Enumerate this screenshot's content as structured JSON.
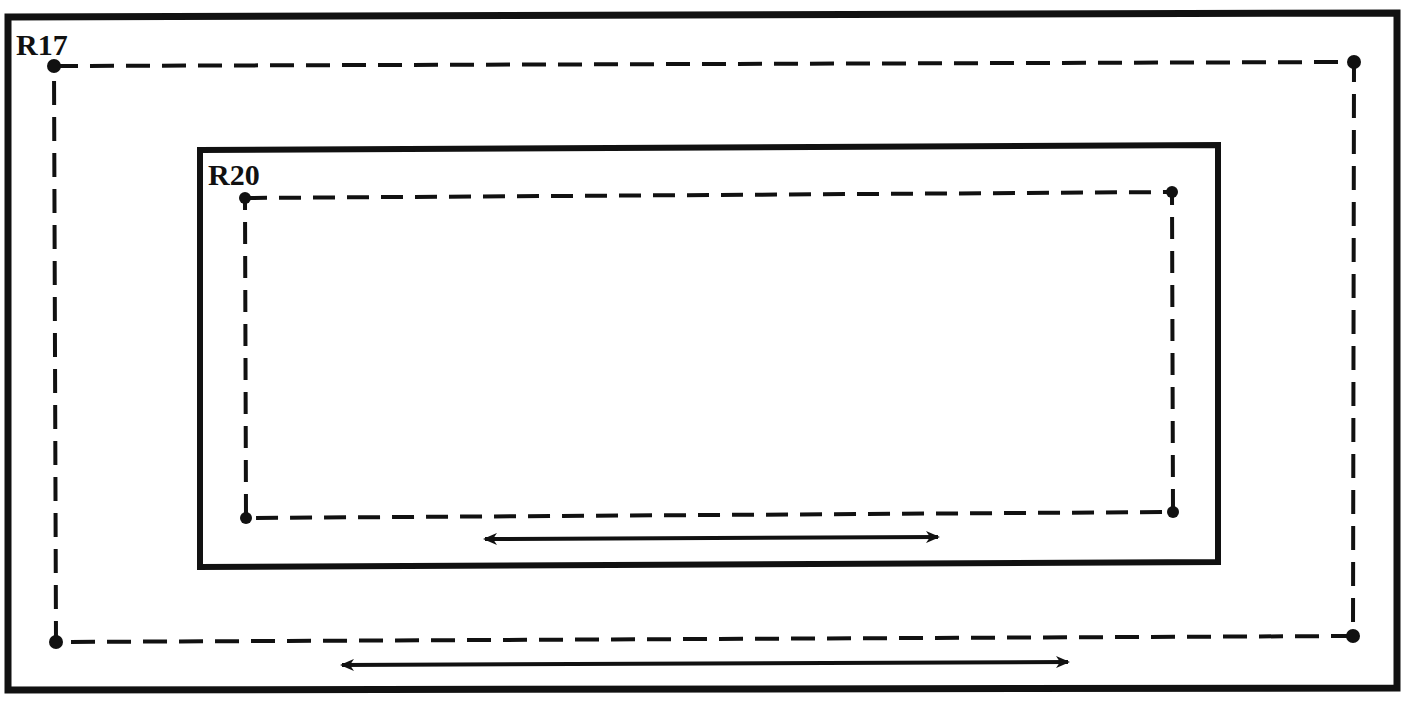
{
  "diagram": {
    "type": "nested-rectangles",
    "stroke_color": "#111111",
    "background": "#ffffff",
    "regions": [
      {
        "id": "R17",
        "label": "R17",
        "outer_rect": {
          "x1": 8,
          "y1": 17,
          "x2": 1397,
          "y2": 688
        },
        "dashed_rect": {
          "x1": 54,
          "y1": 66,
          "x2": 1354,
          "y2": 638
        },
        "corner_points": [
          [
            54,
            66
          ],
          [
            1354,
            62
          ],
          [
            1353,
            636
          ],
          [
            56,
            642
          ]
        ],
        "arrow": {
          "x1": 340,
          "y1": 665,
          "x2": 1070,
          "y2": 662,
          "style": "double-headed"
        }
      },
      {
        "id": "R20",
        "label": "R20",
        "outer_rect": {
          "x1": 200,
          "y1": 146,
          "x2": 1218,
          "y2": 567
        },
        "dashed_rect": {
          "x1": 245,
          "y1": 198,
          "x2": 1173,
          "y2": 517
        },
        "corner_points": [
          [
            245,
            198
          ],
          [
            1172,
            192
          ],
          [
            1173,
            512
          ],
          [
            246,
            518
          ]
        ],
        "arrow": {
          "x1": 483,
          "y1": 539,
          "x2": 940,
          "y2": 537,
          "style": "double-headed"
        }
      }
    ]
  }
}
